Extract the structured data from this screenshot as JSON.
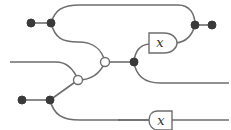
{
  "diagram": {
    "type": "string-diagram",
    "boxes": [
      {
        "id": "upper-x-box",
        "label": "x"
      },
      {
        "id": "lower-x-box",
        "label": "x"
      }
    ],
    "nodes": {
      "black_dots": 6,
      "white_dots": 2
    },
    "colors": {
      "wire": "#6e6e6e",
      "black_node": "#3a3a3a",
      "white_node": "#ffffff"
    }
  }
}
